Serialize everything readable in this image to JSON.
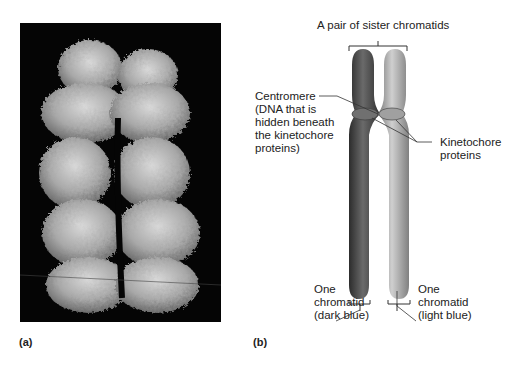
{
  "figure": {
    "panel_a": {
      "label": "(a)",
      "image": "Scanning electron micrograph of a replicated chromosome (grayscale) on black background"
    },
    "panel_b": {
      "label": "(b)",
      "title": "A pair of sister chromatids",
      "labels": {
        "centromere": [
          "Centromere",
          "(DNA that is",
          "hidden beneath",
          "the kinetochore",
          "proteins)"
        ],
        "kinetochore": [
          "Kinetochore",
          "proteins"
        ],
        "chromatid_dark": [
          "One",
          "chromatid",
          "(dark blue)"
        ],
        "chromatid_light": [
          "One",
          "chromatid",
          "(light blue)"
        ]
      },
      "colors": {
        "dark_chromatid": "#4a4a4a",
        "light_chromatid": "#9a9a9a",
        "leader_line": "#333333"
      }
    }
  }
}
